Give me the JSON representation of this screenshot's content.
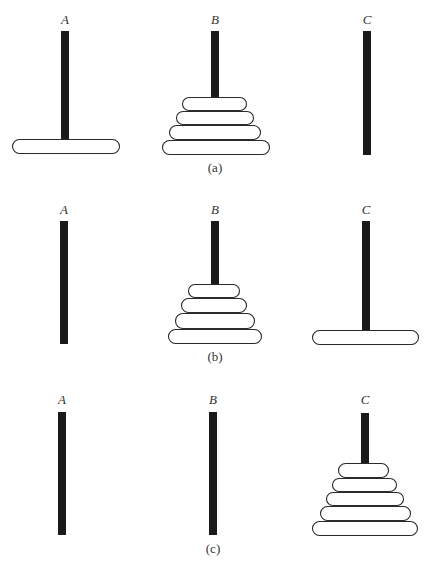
{
  "figure": {
    "colors": {
      "pole": "#1a1a1a",
      "disk_fill": "#ffffff",
      "disk_stroke": "#2a2a2a",
      "text": "#333333",
      "background": "#ffffff"
    },
    "panels": [
      {
        "id": "a",
        "caption": "(a)",
        "caption_pos": {
          "x": 215,
          "y": 172
        },
        "pegs": [
          {
            "label": "A",
            "label_pos": {
              "x": 65,
              "y": 24
            },
            "pole": {
              "x": 61,
              "y": 31,
              "w": 8,
              "h": 109
            },
            "disks": [
              {
                "x": 12,
                "y": 139,
                "w": 108,
                "h": 15
              }
            ]
          },
          {
            "label": "B",
            "label_pos": {
              "x": 215,
              "y": 24
            },
            "pole": {
              "x": 211,
              "y": 31,
              "w": 8,
              "h": 67
            },
            "disks": [
              {
                "x": 182,
                "y": 97,
                "w": 65,
                "h": 14
              },
              {
                "x": 176,
                "y": 111,
                "w": 78,
                "h": 14
              },
              {
                "x": 169,
                "y": 125,
                "w": 92,
                "h": 15
              },
              {
                "x": 162,
                "y": 140,
                "w": 108,
                "h": 15
              }
            ]
          },
          {
            "label": "C",
            "label_pos": {
              "x": 367,
              "y": 24
            },
            "pole": {
              "x": 363,
              "y": 31,
              "w": 8,
              "h": 124
            },
            "disks": []
          }
        ]
      },
      {
        "id": "b",
        "caption": "(b)",
        "caption_pos": {
          "x": 215,
          "y": 361
        },
        "pegs": [
          {
            "label": "A",
            "label_pos": {
              "x": 64,
              "y": 214
            },
            "pole": {
              "x": 60,
              "y": 221,
              "w": 8,
              "h": 123
            },
            "disks": []
          },
          {
            "label": "B",
            "label_pos": {
              "x": 215,
              "y": 214
            },
            "pole": {
              "x": 211,
              "y": 221,
              "w": 8,
              "h": 64
            },
            "disks": [
              {
                "x": 188,
                "y": 284,
                "w": 52,
                "h": 14
              },
              {
                "x": 181,
                "y": 298,
                "w": 66,
                "h": 15
              },
              {
                "x": 175,
                "y": 313,
                "w": 80,
                "h": 16
              },
              {
                "x": 168,
                "y": 329,
                "w": 94,
                "h": 15
              }
            ]
          },
          {
            "label": "C",
            "label_pos": {
              "x": 366,
              "y": 214
            },
            "pole": {
              "x": 362,
              "y": 221,
              "w": 8,
              "h": 110
            },
            "disks": [
              {
                "x": 312,
                "y": 330,
                "w": 107,
                "h": 15
              }
            ]
          }
        ]
      },
      {
        "id": "c",
        "caption": "(c)",
        "caption_pos": {
          "x": 213,
          "y": 553
        },
        "pegs": [
          {
            "label": "A",
            "label_pos": {
              "x": 62,
              "y": 404
            },
            "pole": {
              "x": 58,
              "y": 412,
              "w": 8,
              "h": 123
            },
            "disks": []
          },
          {
            "label": "B",
            "label_pos": {
              "x": 213,
              "y": 404
            },
            "pole": {
              "x": 209,
              "y": 412,
              "w": 8,
              "h": 123
            },
            "disks": []
          },
          {
            "label": "C",
            "label_pos": {
              "x": 365,
              "y": 404
            },
            "pole": {
              "x": 361,
              "y": 413,
              "w": 8,
              "h": 51
            },
            "disks": [
              {
                "x": 338,
                "y": 463,
                "w": 51,
                "h": 15
              },
              {
                "x": 332,
                "y": 478,
                "w": 65,
                "h": 14
              },
              {
                "x": 326,
                "y": 492,
                "w": 78,
                "h": 14
              },
              {
                "x": 320,
                "y": 506,
                "w": 91,
                "h": 15
              },
              {
                "x": 312,
                "y": 521,
                "w": 106,
                "h": 15
              }
            ]
          }
        ]
      }
    ]
  }
}
